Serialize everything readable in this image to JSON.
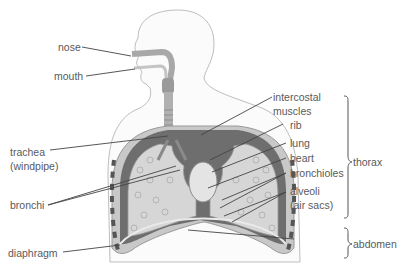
{
  "diagram": {
    "labels_left": [
      {
        "id": "nose",
        "text": "nose"
      },
      {
        "id": "mouth",
        "text": "mouth"
      },
      {
        "id": "trachea",
        "text": "trachea"
      },
      {
        "id": "trachea_alt",
        "text": "(windpipe)"
      },
      {
        "id": "bronchi",
        "text": "bronchi"
      },
      {
        "id": "diaphragm",
        "text": "diaphragm"
      }
    ],
    "labels_right": [
      {
        "id": "intercostal",
        "text": "intercostal"
      },
      {
        "id": "intercostal2",
        "text": "muscles"
      },
      {
        "id": "rib",
        "text": "rib"
      },
      {
        "id": "lung",
        "text": "lung"
      },
      {
        "id": "heart",
        "text": "heart"
      },
      {
        "id": "bronchioles",
        "text": "bronchioles"
      },
      {
        "id": "alveoli",
        "text": "alveoli"
      },
      {
        "id": "alveoli_alt",
        "text": "(air sacs)"
      }
    ],
    "regions": [
      {
        "id": "thorax",
        "text": "thorax"
      },
      {
        "id": "abdomen",
        "text": "abdomen"
      }
    ],
    "colors": {
      "outline": "#b5b5b5",
      "pleura_dark": "#6e6e6e",
      "lung_fill": "#d4d4d4",
      "airway": "#a9a9a9",
      "leader": "#444444",
      "text": "#5a5a5a"
    }
  }
}
